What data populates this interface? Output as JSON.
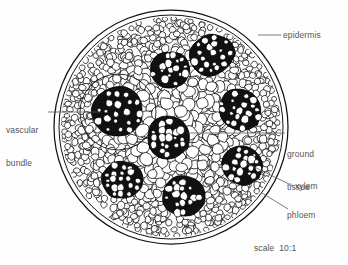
{
  "figure": {
    "scale_note": "scale  10:1",
    "stroke_color": "#1a1a1a",
    "fill_ground": "#ffffff",
    "fill_bundle": "#111111",
    "label_color": "#555555"
  },
  "labels": {
    "epidermis": "epidermis",
    "vascular_bundle_line1": "vascular",
    "vascular_bundle_line2": "bundle",
    "ground_tissue_line1": "ground",
    "ground_tissue_line2": "tissue",
    "xylem": "xylem",
    "phloem": "phloem"
  },
  "structures": {
    "outline": {
      "cx": 171,
      "cy": 127,
      "r": 117,
      "inner_r": 112
    },
    "bundles": [
      {
        "name": "bundle-upper-left",
        "cx": 118,
        "cy": 112,
        "rx": 25,
        "ry": 24,
        "rot": 0,
        "ring": true
      },
      {
        "name": "bundle-upper-mid",
        "cx": 170,
        "cy": 70,
        "rx": 20,
        "ry": 18,
        "rot": -15,
        "ring": false
      },
      {
        "name": "bundle-upper-right",
        "cx": 212,
        "cy": 55,
        "rx": 22,
        "ry": 20,
        "rot": -25,
        "ring": false
      },
      {
        "name": "bundle-right",
        "cx": 240,
        "cy": 110,
        "rx": 22,
        "ry": 20,
        "rot": 20,
        "ring": false
      },
      {
        "name": "bundle-center",
        "cx": 168,
        "cy": 138,
        "rx": 18,
        "ry": 20,
        "rot": 0,
        "ring": false
      },
      {
        "name": "bundle-lower-right",
        "cx": 242,
        "cy": 165,
        "rx": 19,
        "ry": 19,
        "rot": 15,
        "ring": false
      },
      {
        "name": "bundle-lower-left",
        "cx": 122,
        "cy": 180,
        "rx": 20,
        "ry": 18,
        "rot": 0,
        "ring": false
      },
      {
        "name": "bundle-bottom",
        "cx": 184,
        "cy": 196,
        "rx": 21,
        "ry": 20,
        "rot": 0,
        "ring": false
      }
    ],
    "leaders": [
      {
        "name": "leader-epidermis",
        "x1": 258,
        "y1": 35,
        "x2": 281,
        "y2": 35
      },
      {
        "name": "leader-vascular-bundle",
        "x1": 48,
        "y1": 112,
        "x2": 100,
        "y2": 112
      },
      {
        "name": "leader-ground-tissue",
        "x1": 188,
        "y1": 133,
        "x2": 285,
        "y2": 133
      },
      {
        "name": "leader-xylem",
        "x1": 246,
        "y1": 163,
        "x2": 293,
        "y2": 186
      },
      {
        "name": "leader-phloem",
        "x1": 262,
        "y1": 193,
        "x2": 288,
        "y2": 209
      }
    ]
  }
}
